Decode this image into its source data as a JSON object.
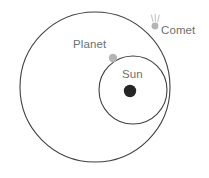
{
  "figure": {
    "title": "",
    "background_color": "#ffffff",
    "width": 209,
    "height": 178
  },
  "labels": {
    "planet": "Planet",
    "comet": "Comet",
    "sun": "Sun"
  },
  "colors": {
    "orbit_stroke": "#3f3f46",
    "sun_fill": "#262626",
    "body_fill": "#b5b5b5",
    "label_text": "#6f6f6f",
    "comet_tail": "#c9c9c9"
  },
  "chart_data": {
    "type": "diagram",
    "title": "",
    "xlabel": "",
    "ylabel": "",
    "grid": false,
    "legend": "none",
    "objects": [
      {
        "name": "comet-orbit",
        "kind": "orbit-circle",
        "label": "",
        "center": [
          95,
          87
        ],
        "radius": 75,
        "stroke": "#3f3f46",
        "stroke_width": 1.1,
        "fill": "none"
      },
      {
        "name": "planet-orbit",
        "kind": "orbit-circle",
        "label": "",
        "center": [
          133,
          90
        ],
        "radius": 34,
        "stroke": "#3f3f46",
        "stroke_width": 1.1,
        "fill": "none"
      },
      {
        "name": "sun",
        "kind": "body",
        "label": "Sun",
        "center": [
          130,
          91
        ],
        "radius": 6.2,
        "fill": "#262626",
        "label_position": [
          122,
          68
        ]
      },
      {
        "name": "planet",
        "kind": "body",
        "label": "Planet",
        "center": [
          113,
          58
        ],
        "radius": 4.2,
        "fill": "#b5b5b5",
        "label_position": [
          73,
          38
        ],
        "on_orbit": "planet-orbit"
      },
      {
        "name": "comet",
        "kind": "body",
        "label": "Comet",
        "center": [
          155,
          26
        ],
        "radius": 3.4,
        "fill": "#b5b5b5",
        "label_position": [
          161,
          24
        ],
        "on_orbit": "comet-orbit",
        "tail_rays": [
          {
            "x1": 153.0,
            "y1": 21.5,
            "x2": 151.4,
            "y2": 15.0
          },
          {
            "x1": 155.4,
            "y1": 21.2,
            "x2": 155.2,
            "y2": 14.4
          },
          {
            "x1": 157.6,
            "y1": 21.8,
            "x2": 159.2,
            "y2": 15.2
          }
        ],
        "tail_stroke": "#c9c9c9",
        "tail_stroke_width": 1.2
      }
    ]
  }
}
